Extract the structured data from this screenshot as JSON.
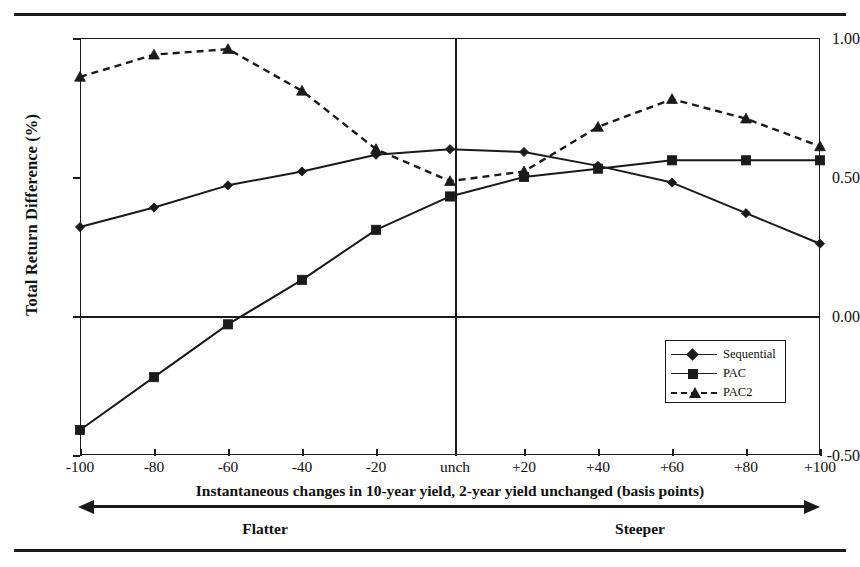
{
  "chart_data": {
    "type": "line",
    "title": "",
    "xlabel": "Instantaneous changes in 10-year yield, 2-year yield unchanged (basis points)",
    "ylabel": "Total Return Difference (%)",
    "categories": [
      "-100",
      "-80",
      "-60",
      "-40",
      "-20",
      "unch",
      "+20",
      "+40",
      "+60",
      "+80",
      "+100"
    ],
    "x_values": [
      -100,
      -80,
      -60,
      -40,
      -20,
      0,
      20,
      40,
      60,
      80,
      100
    ],
    "xlim": [
      -100,
      100
    ],
    "ylim": [
      -0.5,
      1.0
    ],
    "y_ticks": [
      "-0.50",
      "0.00",
      "0.50",
      "1.00"
    ],
    "y_tick_values": [
      -0.5,
      0.0,
      0.5,
      1.0
    ],
    "grid": false,
    "legend_position": "lower-right-inside",
    "series": [
      {
        "name": "Sequential",
        "marker": "diamond",
        "linestyle": "solid",
        "values": [
          0.32,
          0.39,
          0.47,
          0.52,
          0.58,
          0.6,
          0.59,
          0.54,
          0.48,
          0.37,
          0.26
        ]
      },
      {
        "name": "PAC",
        "marker": "square",
        "linestyle": "solid",
        "values": [
          -0.41,
          -0.22,
          -0.03,
          0.13,
          0.31,
          0.43,
          0.5,
          0.53,
          0.56,
          0.56,
          0.56
        ]
      },
      {
        "name": "PAC2",
        "marker": "triangle",
        "linestyle": "dashed",
        "values": [
          0.86,
          0.94,
          0.96,
          0.81,
          0.6,
          0.485,
          0.52,
          0.68,
          0.78,
          0.71,
          0.61
        ]
      }
    ],
    "annotations": {
      "zero_reference_line": 0.0,
      "unch_reference_line": "unch",
      "direction_left": "Flatter",
      "direction_right": "Steeper"
    }
  },
  "axis": {
    "y_label": "Total Return Difference (%)",
    "x_caption": "Instantaneous changes in 10-year yield, 2-year yield unchanged (basis points)",
    "y_ticks": [
      "1.00",
      "0.50",
      "0.00",
      "-0.50"
    ],
    "x_ticks": [
      "-100",
      "-80",
      "-60",
      "-40",
      "-20",
      "unch",
      "+20",
      "+40",
      "+60",
      "+80",
      "+100"
    ]
  },
  "legend": {
    "items": [
      {
        "label": "Sequential",
        "marker": "diamond-marker",
        "style": "solid"
      },
      {
        "label": "PAC",
        "marker": "square-marker",
        "style": "solid"
      },
      {
        "label": "PAC2",
        "marker": "triangle-marker",
        "style": "dashed"
      }
    ]
  },
  "direction": {
    "left": "Flatter",
    "right": "Steeper"
  },
  "colors": {
    "ink": "#1a1a1a",
    "background": "#ffffff"
  }
}
